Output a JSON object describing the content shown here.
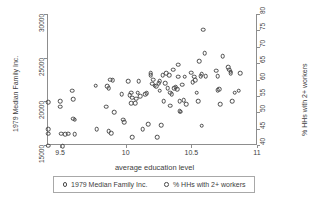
{
  "chart_data": {
    "type": "scatter",
    "title": "",
    "xlabel": "average education level",
    "ylabel": "1979 Median Family Inc.",
    "ylabel_right": "% HHs with 2+ workers",
    "xlim": [
      9.4,
      11.0
    ],
    "ylim": [
      15000,
      30000
    ],
    "ylim_right": [
      40,
      80
    ],
    "grid": false,
    "legend_position": "below",
    "xticks": [
      "9.5",
      "10",
      "10.5",
      "11"
    ],
    "xtick_values": [
      9.5,
      10,
      10.5,
      11
    ],
    "yticks_left": [
      "15000",
      "20000",
      "25000",
      "30000"
    ],
    "ytick_values_left": [
      15000,
      20000,
      25000,
      30000
    ],
    "yticks_right": [
      "40",
      "45",
      "50",
      "55",
      "60",
      "65",
      "70",
      "75",
      "80"
    ],
    "ytick_values_right": [
      40,
      45,
      50,
      55,
      60,
      65,
      70,
      75,
      80
    ],
    "series": [
      {
        "name": "1979 Median Family Inc.",
        "marker": "open-circle",
        "color": "#4a4a4a",
        "points": [
          [
            9.41,
            19900
          ],
          [
            9.41,
            16800
          ],
          [
            9.41,
            16300
          ],
          [
            9.41,
            14900
          ],
          [
            9.5,
            20000
          ],
          [
            9.5,
            19400
          ],
          [
            9.51,
            16300
          ],
          [
            9.52,
            14850
          ],
          [
            9.54,
            16250
          ],
          [
            9.56,
            16300
          ],
          [
            9.59,
            21200
          ],
          [
            9.6,
            20250
          ],
          [
            9.6,
            18000
          ],
          [
            9.61,
            17900
          ],
          [
            9.61,
            16250
          ],
          [
            9.77,
            21800
          ],
          [
            9.78,
            16800
          ],
          [
            9.85,
            19400
          ],
          [
            9.86,
            21700
          ],
          [
            9.87,
            21500
          ],
          [
            9.87,
            16600
          ],
          [
            9.88,
            22500
          ],
          [
            9.89,
            16350
          ],
          [
            9.9,
            22450
          ],
          [
            9.91,
            18750
          ],
          [
            9.97,
            20800
          ],
          [
            9.98,
            17900
          ],
          [
            9.99,
            17600
          ],
          [
            10.02,
            22300
          ],
          [
            10.03,
            20700
          ],
          [
            10.04,
            19800
          ],
          [
            10.04,
            21000
          ],
          [
            10.05,
            20400
          ],
          [
            10.05,
            15900
          ],
          [
            10.07,
            19800
          ],
          [
            10.08,
            20300
          ],
          [
            10.09,
            21000
          ],
          [
            10.1,
            22300
          ],
          [
            10.11,
            20600
          ],
          [
            10.13,
            16800
          ],
          [
            10.15,
            20800
          ],
          [
            10.16,
            20900
          ],
          [
            10.17,
            17400
          ],
          [
            10.19,
            23200
          ],
          [
            10.19,
            23000
          ],
          [
            10.2,
            22000
          ],
          [
            10.21,
            22500
          ],
          [
            10.22,
            21800
          ],
          [
            10.23,
            21700
          ],
          [
            10.24,
            15900
          ],
          [
            10.25,
            22100
          ],
          [
            10.26,
            22300
          ],
          [
            10.26,
            21200
          ],
          [
            10.27,
            17300
          ],
          [
            10.28,
            23000
          ],
          [
            10.29,
            20000
          ],
          [
            10.3,
            22100
          ],
          [
            10.31,
            23200
          ],
          [
            10.32,
            21500
          ],
          [
            10.33,
            23000
          ],
          [
            10.34,
            21000
          ],
          [
            10.34,
            19500
          ],
          [
            10.35,
            20800
          ],
          [
            10.36,
            23600
          ],
          [
            10.37,
            21500
          ],
          [
            10.38,
            21600
          ],
          [
            10.39,
            21400
          ],
          [
            10.4,
            24200
          ],
          [
            10.4,
            22800
          ],
          [
            10.41,
            20000
          ],
          [
            10.41,
            18900
          ],
          [
            10.42,
            18800
          ],
          [
            10.43,
            21900
          ],
          [
            10.44,
            20100
          ],
          [
            10.45,
            22800
          ],
          [
            10.46,
            19700
          ],
          [
            10.5,
            23300
          ],
          [
            10.51,
            22200
          ],
          [
            10.52,
            22800
          ],
          [
            10.53,
            22400
          ],
          [
            10.54,
            21000
          ],
          [
            10.55,
            20000
          ],
          [
            10.56,
            24600
          ],
          [
            10.57,
            22900
          ],
          [
            10.58,
            23100
          ],
          [
            10.58,
            17200
          ],
          [
            10.59,
            28200
          ],
          [
            10.6,
            25500
          ],
          [
            10.61,
            22900
          ],
          [
            10.69,
            23500
          ],
          [
            10.7,
            22900
          ],
          [
            10.7,
            21300
          ],
          [
            10.71,
            21400
          ],
          [
            10.72,
            19700
          ],
          [
            10.74,
            25200
          ],
          [
            10.78,
            23900
          ],
          [
            10.79,
            23600
          ],
          [
            10.8,
            23400
          ],
          [
            10.8,
            23200
          ],
          [
            10.81,
            20000
          ],
          [
            10.83,
            21000
          ],
          [
            10.86,
            21200
          ],
          [
            10.87,
            23200
          ]
        ]
      }
    ]
  },
  "legend": {
    "entries": [
      {
        "label": "1979 Median Family Inc.",
        "marker": "open-circle"
      },
      {
        "label": "% HHs with 2+ workers",
        "marker": "open-circle"
      }
    ]
  }
}
